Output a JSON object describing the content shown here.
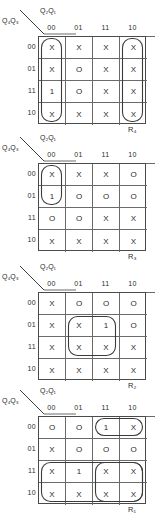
{
  "figure": {
    "type": "karnaugh-map-set",
    "count": 4,
    "col_axis_label": "Q2Q1",
    "row_axis_label": "Q4Q3",
    "col_headers": [
      "00",
      "01",
      "11",
      "10"
    ],
    "row_headers": [
      "00",
      "01",
      "11",
      "10"
    ],
    "ink_color": "#3c3c3c",
    "grid_color": "#6a6a6a"
  },
  "maps": [
    {
      "output": "R4",
      "output_main": "R",
      "output_sub": "4",
      "rows": [
        [
          "X",
          "X",
          "X",
          "X"
        ],
        [
          "X",
          "O",
          "X",
          "X"
        ],
        [
          "1",
          "O",
          "X",
          "X"
        ],
        [
          "X",
          "X",
          "X",
          "X"
        ]
      ],
      "groups": [
        {
          "name": "column-00-wrap",
          "col": 0,
          "row": 0,
          "w": 1,
          "h": 4
        },
        {
          "name": "column-10-wrap",
          "col": 3,
          "row": 0,
          "w": 1,
          "h": 4
        }
      ]
    },
    {
      "output": "R3",
      "output_main": "R",
      "output_sub": "3",
      "rows": [
        [
          "X",
          "X",
          "X",
          "O"
        ],
        [
          "1",
          "O",
          "O",
          "O"
        ],
        [
          "O",
          "O",
          "X",
          "X"
        ],
        [
          "X",
          "X",
          "X",
          "X"
        ]
      ],
      "groups": [
        {
          "name": "col-00-rows-00-01",
          "col": 0,
          "row": 0,
          "w": 1,
          "h": 2
        }
      ]
    },
    {
      "output": "R2",
      "output_main": "R",
      "output_sub": "2",
      "rows": [
        [
          "X",
          "O",
          "O",
          "O"
        ],
        [
          "X",
          "X",
          "1",
          "O"
        ],
        [
          "X",
          "X",
          "X",
          "X"
        ],
        [
          "X",
          "X",
          "X",
          "X"
        ]
      ],
      "groups": [
        {
          "name": "quad-rows-01-11-cols-01-11",
          "col": 1,
          "row": 1,
          "w": 2,
          "h": 2
        }
      ]
    },
    {
      "output": "R1",
      "output_main": "R",
      "output_sub": "1",
      "rows": [
        [
          "O",
          "O",
          "1",
          "X"
        ],
        [
          "X",
          "O",
          "O",
          "O"
        ],
        [
          "X",
          "1",
          "X",
          "X"
        ],
        [
          "X",
          "X",
          "X",
          "X"
        ]
      ],
      "groups": [
        {
          "name": "pair-row-00-cols-11-10",
          "col": 2,
          "row": 0,
          "w": 2,
          "h": 1
        },
        {
          "name": "octet-rows-11-10",
          "col": 0,
          "row": 2,
          "w": 4,
          "h": 2
        },
        {
          "name": "quad-rows-11-10-cols-11-10",
          "col": 2,
          "row": 2,
          "w": 2,
          "h": 2
        }
      ]
    }
  ]
}
